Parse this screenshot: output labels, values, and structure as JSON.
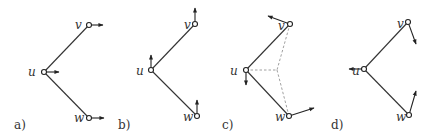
{
  "figure": {
    "panels": [
      {
        "label": "a)",
        "label_pos": [
          14,
          129
        ],
        "nodes": {
          "v": {
            "name": "v",
            "pos": [
              89,
              25
            ],
            "label_pos": [
              75,
              29
            ]
          },
          "u": {
            "name": "u",
            "pos": [
              44,
              72
            ],
            "label_pos": [
              28,
              76
            ]
          },
          "w": {
            "name": "w",
            "pos": [
              89,
              118
            ],
            "label_pos": [
              74,
              122
            ]
          }
        },
        "edges": [
          [
            "u",
            "v"
          ],
          [
            "u",
            "w"
          ]
        ],
        "dashed": [],
        "vectors": {
          "v": [
            103,
            25
          ],
          "u": [
            59,
            72
          ],
          "w": [
            104,
            118
          ]
        }
      },
      {
        "label": "b)",
        "label_pos": [
          118,
          129
        ],
        "nodes": {
          "v": {
            "name": "v",
            "pos": [
              195,
              24
            ],
            "label_pos": [
              184,
              29
            ]
          },
          "u": {
            "name": "u",
            "pos": [
              151,
              70
            ],
            "label_pos": [
              136,
              75
            ]
          },
          "w": {
            "name": "w",
            "pos": [
              197,
              116
            ],
            "label_pos": [
              183,
              121
            ]
          }
        },
        "edges": [
          [
            "u",
            "v"
          ],
          [
            "u",
            "w"
          ]
        ],
        "dashed": [],
        "vectors": {
          "v": [
            195,
            8
          ],
          "u": [
            151,
            55
          ],
          "w": [
            197,
            100
          ]
        }
      },
      {
        "label": "c)",
        "label_pos": [
          222,
          129
        ],
        "nodes": {
          "v": {
            "name": "v",
            "pos": [
              290,
              24
            ],
            "label_pos": [
              278,
              30
            ]
          },
          "u": {
            "name": "u",
            "pos": [
              246,
              70
            ],
            "label_pos": [
              230,
              75
            ]
          },
          "w": {
            "name": "w",
            "pos": [
              289,
              116
            ],
            "label_pos": [
              275,
              121
            ]
          }
        },
        "edges": [
          [
            "u",
            "v"
          ],
          [
            "u",
            "w"
          ]
        ],
        "dashed": [
          [
            [
              246,
              70
            ],
            [
              277,
              70
            ]
          ],
          [
            [
              290,
              24
            ],
            [
              277,
              70
            ]
          ],
          [
            [
              289,
              116
            ],
            [
              277,
              70
            ]
          ]
        ],
        "vectors": {
          "v": [
            268,
            16
          ],
          "u": [
            246,
            85
          ],
          "w": [
            314,
            108
          ]
        }
      },
      {
        "label": "d)",
        "label_pos": [
          331,
          129
        ],
        "nodes": {
          "v": {
            "name": "v",
            "pos": [
              408,
              22
            ],
            "label_pos": [
              397,
              28
            ]
          },
          "u": {
            "name": "u",
            "pos": [
              364,
              69
            ],
            "label_pos": [
              352,
              75
            ]
          },
          "w": {
            "name": "w",
            "pos": [
              409,
              115
            ],
            "label_pos": [
              396,
              121
            ]
          }
        },
        "edges": [
          [
            "u",
            "v"
          ],
          [
            "u",
            "w"
          ]
        ],
        "dashed": [],
        "vectors": {
          "v": [
            416,
            44
          ],
          "u": [
            349,
            69
          ],
          "w": [
            416,
            91
          ]
        }
      }
    ]
  }
}
